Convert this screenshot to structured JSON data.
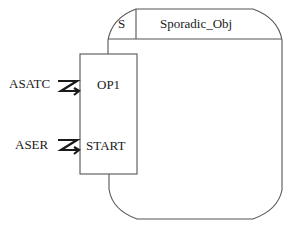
{
  "diagram": {
    "object": {
      "kind_label": "S",
      "name": "Sporadic_Obj"
    },
    "operations_box": {
      "operations": [
        {
          "name": "OP1",
          "caller": "ASATC",
          "connector": "asynchronous-message-icon"
        },
        {
          "name": "START",
          "caller": "ASER",
          "connector": "asynchronous-message-icon"
        }
      ]
    },
    "colors": {
      "line": "#555555",
      "text": "#1a1a1a",
      "background": "#ffffff"
    }
  }
}
